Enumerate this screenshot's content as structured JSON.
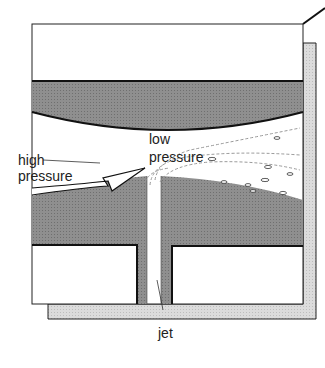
{
  "diagram": {
    "labels": {
      "high_line1": "high",
      "high_line2": "pressure",
      "low_line1": "low",
      "low_line2": "pressure",
      "jet": "jet"
    },
    "colors": {
      "dark_fill": "#8a8a8a",
      "light_fill": "#d6d6d6",
      "stroke": "#111111",
      "background": "#ffffff"
    }
  }
}
